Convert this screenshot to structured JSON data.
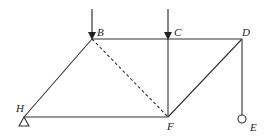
{
  "diagram": {
    "type": "truss",
    "colors": {
      "stroke": "#333333",
      "background": "#ffffff"
    },
    "nodes": {
      "B": {
        "label": "B"
      },
      "C": {
        "label": "C"
      },
      "D": {
        "label": "D"
      },
      "H": {
        "label": "H"
      },
      "F": {
        "label": "F"
      },
      "E": {
        "label": "E"
      }
    },
    "members": [
      {
        "from": "H",
        "to": "B",
        "style": "solid"
      },
      {
        "from": "B",
        "to": "C",
        "style": "solid"
      },
      {
        "from": "C",
        "to": "D",
        "style": "solid"
      },
      {
        "from": "H",
        "to": "F",
        "style": "solid"
      },
      {
        "from": "C",
        "to": "F",
        "style": "solid"
      },
      {
        "from": "F",
        "to": "D",
        "style": "solid"
      },
      {
        "from": "B",
        "to": "F",
        "style": "dashed"
      },
      {
        "from": "D",
        "to": "E",
        "style": "solid"
      }
    ],
    "loads": [
      {
        "node": "B",
        "direction": "down"
      },
      {
        "node": "C",
        "direction": "down"
      }
    ],
    "supports": [
      {
        "node": "H",
        "type": "pin-triangle"
      },
      {
        "node": "E",
        "type": "hanging-circle"
      }
    ]
  }
}
